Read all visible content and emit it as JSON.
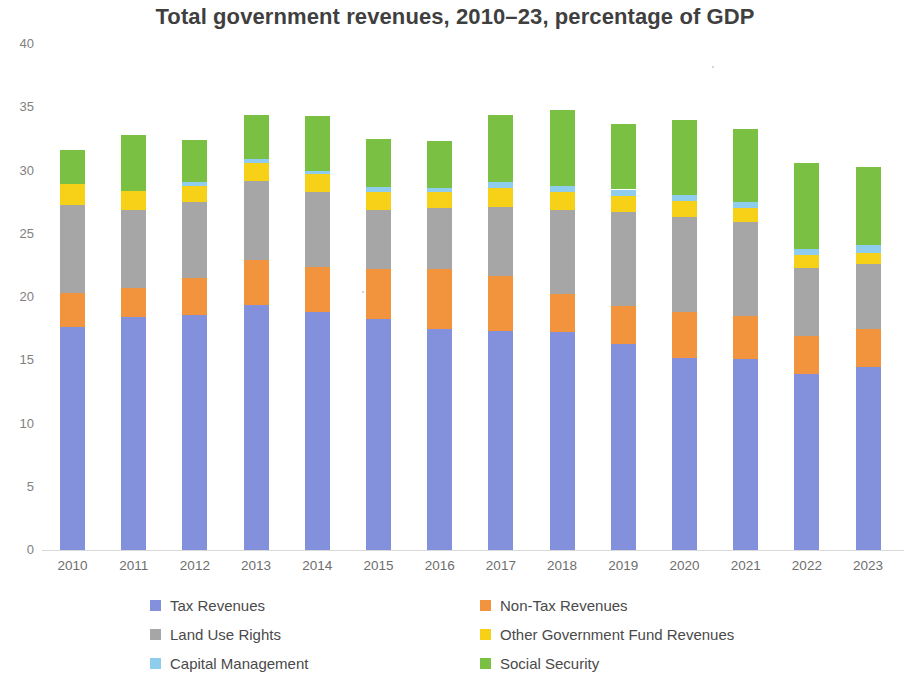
{
  "chart_data": {
    "type": "bar",
    "stacked": true,
    "title": "Total government revenues, 2010–23, percentage of GDP",
    "xlabel": "",
    "ylabel": "",
    "ylim": [
      0,
      40
    ],
    "ytick_step": 5,
    "ytick_labels": [
      "0",
      "5",
      "10",
      "15",
      "20",
      "25",
      "30",
      "35",
      "40"
    ],
    "grid": false,
    "legend_position": "bottom",
    "categories": [
      "2010",
      "2011",
      "2012",
      "2013",
      "2014",
      "2015",
      "2016",
      "2017",
      "2018",
      "2019",
      "2020",
      "2021",
      "2022",
      "2023"
    ],
    "series": [
      {
        "name": "Tax Revenues",
        "color": "#8391dd",
        "values": [
          17.6,
          18.4,
          18.6,
          19.4,
          18.8,
          18.3,
          17.5,
          17.3,
          17.2,
          16.3,
          15.2,
          15.1,
          13.9,
          14.5
        ]
      },
      {
        "name": "Non-Tax Revenues",
        "color": "#f2933e",
        "values": [
          2.7,
          2.3,
          2.9,
          3.5,
          3.6,
          3.9,
          4.7,
          4.4,
          3.0,
          3.0,
          3.6,
          3.4,
          3.0,
          3.0
        ]
      },
      {
        "name": "Land Use Rights",
        "color": "#a6a6a6",
        "values": [
          7.0,
          6.2,
          6.0,
          6.3,
          5.9,
          4.7,
          4.8,
          5.4,
          6.7,
          7.4,
          7.5,
          7.4,
          5.4,
          5.1
        ]
      },
      {
        "name": "Other Government Fund Revenues",
        "color": "#f7d117",
        "values": [
          1.6,
          1.5,
          1.3,
          1.4,
          1.4,
          1.4,
          1.3,
          1.5,
          1.4,
          1.3,
          1.3,
          1.1,
          1.0,
          0.9
        ]
      },
      {
        "name": "Capital Management",
        "color": "#8fcdee",
        "values": [
          0.0,
          0.0,
          0.3,
          0.3,
          0.3,
          0.4,
          0.3,
          0.5,
          0.5,
          0.5,
          0.5,
          0.5,
          0.5,
          0.6
        ]
      },
      {
        "name": "Social Security",
        "color": "#7ac143",
        "values": [
          2.7,
          4.4,
          3.3,
          3.5,
          4.3,
          3.8,
          3.7,
          5.3,
          6.0,
          5.2,
          5.9,
          5.8,
          6.8,
          6.2
        ]
      }
    ],
    "totals": [
      31.6,
      32.8,
      32.4,
      34.4,
      34.3,
      32.5,
      32.3,
      34.4,
      34.8,
      33.7,
      34.0,
      33.3,
      30.6,
      30.3
    ]
  },
  "legend": {
    "items": [
      {
        "label": "Tax Revenues",
        "swatch": "#8391dd"
      },
      {
        "label": "Non-Tax Revenues",
        "swatch": "#f2933e"
      },
      {
        "label": "Land Use Rights",
        "swatch": "#a6a6a6"
      },
      {
        "label": "Other Government Fund Revenues",
        "swatch": "#f7d117"
      },
      {
        "label": "Capital Management",
        "swatch": "#8fcdee"
      },
      {
        "label": "Social Security",
        "swatch": "#7ac143"
      }
    ]
  }
}
